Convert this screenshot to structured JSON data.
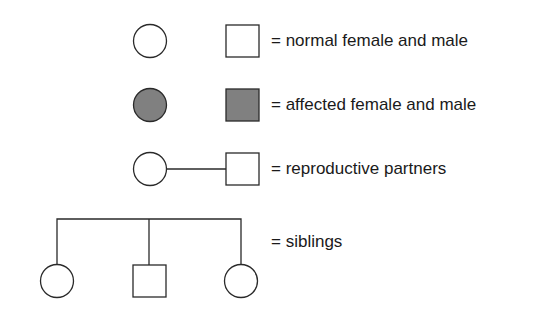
{
  "legend": {
    "rows": [
      {
        "label": "= normal female and male",
        "symbols": [
          "circle-empty",
          "square-empty"
        ]
      },
      {
        "label": "= affected female and male",
        "symbols": [
          "circle-filled",
          "square-filled"
        ]
      },
      {
        "label": "= reproductive partners",
        "symbols": [
          "circle-empty",
          "line",
          "square-empty"
        ]
      },
      {
        "label": "= siblings",
        "symbols": [
          "circle-empty",
          "square-empty",
          "circle-empty"
        ]
      }
    ]
  },
  "colors": {
    "stroke": "#2a2a2a",
    "affected_fill": "#808080",
    "background": "#ffffff"
  }
}
